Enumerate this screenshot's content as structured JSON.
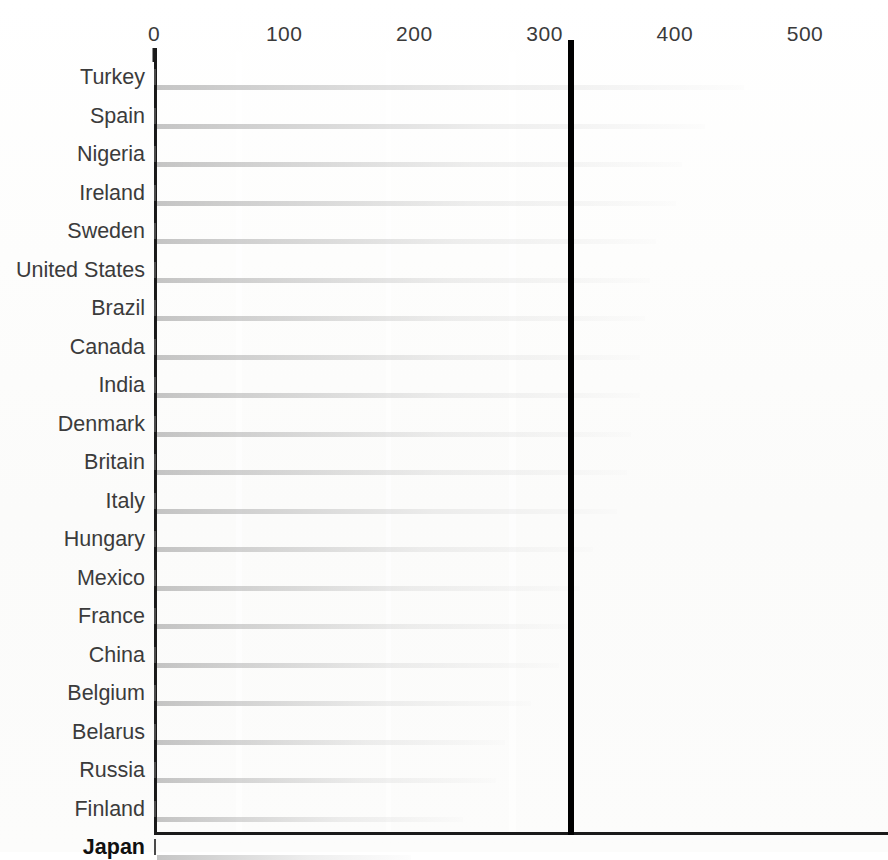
{
  "chart_data": {
    "type": "bar",
    "orientation": "horizontal",
    "title": "",
    "subtitle": "",
    "xlabel": "",
    "ylabel": "",
    "xlim": [
      0,
      520
    ],
    "xticks": [
      0,
      100,
      200,
      300,
      400,
      500
    ],
    "xtick_labels": [
      "0",
      "100",
      "200",
      "300",
      "400",
      "500"
    ],
    "grid": false,
    "legend": "none",
    "reference_line": {
      "value": 320,
      "label": "",
      "color": "#000000"
    },
    "highlight_category": "Japan",
    "categories": [
      "Turkey",
      "Spain",
      "Nigeria",
      "Ireland",
      "Sweden",
      "United States",
      "Brazil",
      "Canada",
      "India",
      "Denmark",
      "Britain",
      "Italy",
      "Hungary",
      "Mexico",
      "France",
      "China",
      "Belgium",
      "Belarus",
      "Russia",
      "Finland",
      "Japan"
    ],
    "values": [
      451,
      421,
      403,
      399,
      383,
      379,
      375,
      371,
      371,
      364,
      361,
      353,
      335,
      325,
      319,
      309,
      287,
      267,
      260,
      235,
      195
    ],
    "bars": [
      {
        "label": "Turkey",
        "value": 451,
        "bold": false
      },
      {
        "label": "Spain",
        "value": 421,
        "bold": false
      },
      {
        "label": "Nigeria",
        "value": 403,
        "bold": false
      },
      {
        "label": "Ireland",
        "value": 399,
        "bold": false
      },
      {
        "label": "Sweden",
        "value": 383,
        "bold": false
      },
      {
        "label": "United States",
        "value": 379,
        "bold": false
      },
      {
        "label": "Brazil",
        "value": 375,
        "bold": false
      },
      {
        "label": "Canada",
        "value": 371,
        "bold": false
      },
      {
        "label": "India",
        "value": 371,
        "bold": false
      },
      {
        "label": "Denmark",
        "value": 364,
        "bold": false
      },
      {
        "label": "Britain",
        "value": 361,
        "bold": false
      },
      {
        "label": "Italy",
        "value": 353,
        "bold": false
      },
      {
        "label": "Hungary",
        "value": 335,
        "bold": false
      },
      {
        "label": "Mexico",
        "value": 325,
        "bold": false
      },
      {
        "label": "France",
        "value": 319,
        "bold": false
      },
      {
        "label": "China",
        "value": 309,
        "bold": false
      },
      {
        "label": "Belgium",
        "value": 287,
        "bold": false
      },
      {
        "label": "Belarus",
        "value": 267,
        "bold": false
      },
      {
        "label": "Russia",
        "value": 260,
        "bold": false
      },
      {
        "label": "Finland",
        "value": 235,
        "bold": false
      },
      {
        "label": "Japan",
        "value": 195,
        "bold": true
      }
    ],
    "colors": {
      "bar_dark": "#2e2e2e",
      "bar_light": "#f0f0f0",
      "bar_border": "#4a4a4a",
      "axis": "#1a1a1a",
      "reference_line": "#000000",
      "label_text": "#3b3b3b",
      "background": "#ffffff"
    }
  }
}
